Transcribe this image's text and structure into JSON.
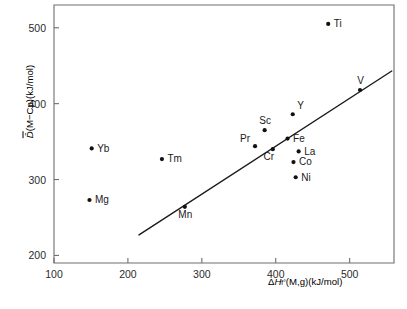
{
  "chart_data": {
    "type": "scatter",
    "title": "",
    "xlabel": "ΔH°f(M,g)(kJ/mol)",
    "ylabel": "D̄(M−Cp)(kJ/mol)",
    "xlim": [
      100,
      560
    ],
    "ylim": [
      190,
      530
    ],
    "xticks": [
      100,
      200,
      300,
      400,
      500
    ],
    "yticks": [
      200,
      300,
      400,
      500
    ],
    "grid": false,
    "legend": null,
    "points": [
      {
        "label": "Yb",
        "x": 151,
        "y": 341,
        "label_pos": "right"
      },
      {
        "label": "Mg",
        "x": 148,
        "y": 273,
        "label_pos": "right"
      },
      {
        "label": "Tm",
        "x": 246,
        "y": 327,
        "label_pos": "right"
      },
      {
        "label": "Mn",
        "x": 277,
        "y": 264,
        "label_pos": "below"
      },
      {
        "label": "Pr",
        "x": 372,
        "y": 344,
        "label_pos": "upper-left"
      },
      {
        "label": "Sc",
        "x": 385,
        "y": 365,
        "label_pos": "above"
      },
      {
        "label": "Cr",
        "x": 396,
        "y": 340,
        "label_pos": "below-left"
      },
      {
        "label": "Fe",
        "x": 416,
        "y": 354,
        "label_pos": "right"
      },
      {
        "label": "La",
        "x": 431,
        "y": 337,
        "label_pos": "right"
      },
      {
        "label": "Co",
        "x": 424,
        "y": 323,
        "label_pos": "right"
      },
      {
        "label": "Ni",
        "x": 427,
        "y": 303,
        "label_pos": "right"
      },
      {
        "label": "Y",
        "x": 423,
        "y": 386,
        "label_pos": "above-right"
      },
      {
        "label": "Ti",
        "x": 471,
        "y": 505,
        "label_pos": "right"
      },
      {
        "label": "V",
        "x": 514,
        "y": 418,
        "label_pos": "above"
      }
    ],
    "trend_line": {
      "x1": 215,
      "y1": 227,
      "x2": 557,
      "y2": 443
    }
  },
  "axis_title_x": {
    "delta": "Δ",
    "h": "H",
    "sup": "°",
    "sub": "f",
    "rest": "(M,g)(kJ/mol)"
  },
  "axis_title_y": {
    "d": "D̄",
    "rest": "(M−Cp)(kJ/mol)"
  }
}
